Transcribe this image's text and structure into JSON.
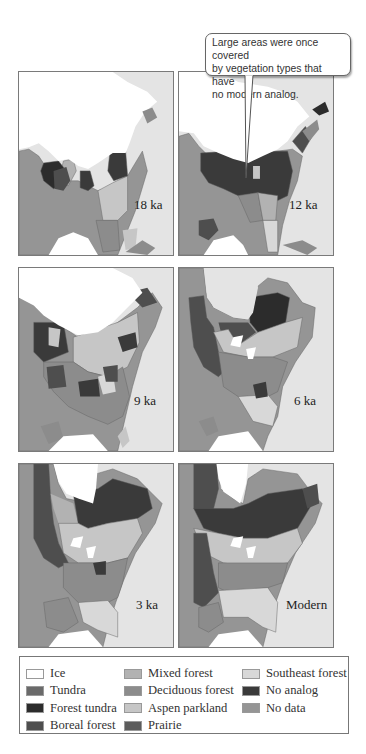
{
  "callout": {
    "lines": [
      "Large areas were once covered",
      "by vegetation types that have",
      "no modern analog."
    ]
  },
  "panels": [
    {
      "label": "18 ka"
    },
    {
      "label": "12 ka"
    },
    {
      "label": "9 ka"
    },
    {
      "label": "6 ka"
    },
    {
      "label": "3 ka"
    },
    {
      "label": "Modern"
    }
  ],
  "legend": {
    "items": [
      {
        "label": "Ice",
        "color": "#ffffff"
      },
      {
        "label": "Tundra",
        "color": "#6a6a6a"
      },
      {
        "label": "Forest tundra",
        "color": "#2c2c2c"
      },
      {
        "label": "Boreal forest",
        "color": "#4e4e4e"
      },
      {
        "label": "Mixed forest",
        "color": "#b2b2b2"
      },
      {
        "label": "Deciduous forest",
        "color": "#8c8c8c"
      },
      {
        "label": "Aspen parkland",
        "color": "#c6c6c6"
      },
      {
        "label": "Prairie",
        "color": "#5c5c5c"
      },
      {
        "label": "Southeast forest",
        "color": "#d8d8d8"
      },
      {
        "label": "No analog",
        "color": "#3a3a3a"
      },
      {
        "label": "No data",
        "color": "#959595"
      }
    ]
  },
  "colors": {
    "ocean": "#e4e4e4",
    "ice": "#ffffff",
    "tundra": "#6a6a6a",
    "forest_tundra": "#2c2c2c",
    "boreal_forest": "#4e4e4e",
    "mixed_forest": "#b2b2b2",
    "deciduous_forest": "#8c8c8c",
    "aspen_parkland": "#c6c6c6",
    "prairie": "#5c5c5c",
    "southeast_forest": "#d8d8d8",
    "no_analog": "#3a3a3a",
    "no_data": "#959595"
  }
}
